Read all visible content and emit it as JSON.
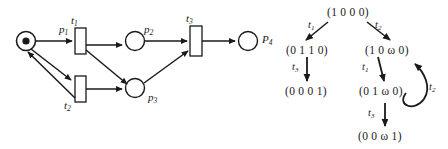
{
  "figure": {
    "kind": "petri-net-and-reachability-tree"
  },
  "petri_net": {
    "places": [
      {
        "id": "p1",
        "label": "p",
        "sub": "1",
        "tokens": 1
      },
      {
        "id": "p2",
        "label": "p",
        "sub": "2",
        "tokens": 0
      },
      {
        "id": "p3",
        "label": "p",
        "sub": "3",
        "tokens": 0
      },
      {
        "id": "p4",
        "label": "P",
        "sub": "4",
        "tokens": 0
      }
    ],
    "transitions": [
      {
        "id": "t1",
        "label": "t",
        "sub": "1"
      },
      {
        "id": "t2",
        "label": "t",
        "sub": "2"
      },
      {
        "id": "t3",
        "label": "t",
        "sub": "3"
      }
    ]
  },
  "tree": {
    "nodes": [
      {
        "id": "root",
        "marking": "(1 0 0 0)"
      },
      {
        "id": "left1",
        "marking": "(0 1 1 0)"
      },
      {
        "id": "left2",
        "marking": "(0 0 0 1)"
      },
      {
        "id": "right1",
        "marking": "(1 0 ω 0)"
      },
      {
        "id": "right2",
        "marking": "(0 1 ω 0)"
      },
      {
        "id": "right3",
        "marking": "(0 0 ω 1)"
      }
    ],
    "arcs": [
      {
        "from": "root",
        "to": "left1",
        "label": "t",
        "sub": "1"
      },
      {
        "from": "root",
        "to": "right1",
        "label": "t",
        "sub": "2"
      },
      {
        "from": "left1",
        "to": "left2",
        "label": "t",
        "sub": "3"
      },
      {
        "from": "right1",
        "to": "right2",
        "label": "t",
        "sub": "1"
      },
      {
        "from": "right2",
        "to": "right1",
        "label": "t",
        "sub": "2"
      },
      {
        "from": "right2",
        "to": "right3",
        "label": "t",
        "sub": "3"
      }
    ]
  },
  "colors": {
    "stroke": "#1a1a1a",
    "fill": "#ffffff",
    "text": "#1a1a1a",
    "background": "#ffffff"
  }
}
